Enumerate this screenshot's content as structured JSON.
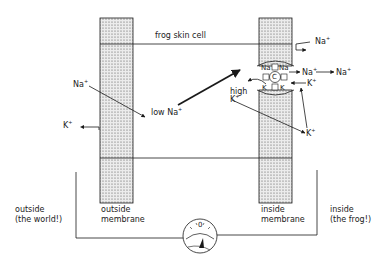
{
  "diagram": {
    "type": "biology-schematic",
    "labels": {
      "cell": "frog skin cell",
      "low_na": "low Na",
      "high_k_1": "high",
      "high_k_2": "K",
      "outside_membrane_1": "outside",
      "outside_membrane_2": "membrane",
      "inside_membrane_1": "inside",
      "inside_membrane_2": "membrane",
      "outside_world_1": "outside",
      "outside_world_2": "(the world!)",
      "inside_frog_1": "inside",
      "inside_frog_2": "(the frog!)"
    },
    "ions": {
      "na_outside": "Na",
      "k_outside": "K",
      "na_top_right": "Na",
      "na_pump_out": "Na",
      "na_far_right": "Na",
      "k_pump_in": "K",
      "k_lower": "K",
      "pump_na_left": "Na",
      "pump_na_right": "Na",
      "pump_k_left": "K",
      "pump_k_right": "K",
      "pump_center": "C",
      "charge": "+"
    },
    "meter": {
      "zero_label": "0",
      "icon": "voltmeter-icon"
    },
    "colors": {
      "ink": "#1a1a1a",
      "membrane_fill": "#d9d9d9"
    }
  }
}
